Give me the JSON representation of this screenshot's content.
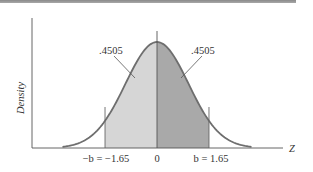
{
  "chart_data": {
    "type": "area",
    "title": "",
    "xlabel": "Z",
    "ylabel": "Density",
    "distribution": "standard normal",
    "x_ticks": [
      {
        "value": -1.65,
        "label": "−b = −1.65"
      },
      {
        "value": 0,
        "label": "0"
      },
      {
        "value": 1.65,
        "label": "b = 1.65"
      }
    ],
    "shaded_regions": [
      {
        "from": -1.65,
        "to": 0,
        "area": 0.4505,
        "label": ".4505",
        "color": "#d6d6d6"
      },
      {
        "from": 0,
        "to": 1.65,
        "area": 0.4505,
        "label": ".4505",
        "color": "#a9a9a9"
      }
    ],
    "xlim": [
      -3.2,
      3.2
    ],
    "grid": false,
    "legend": null
  },
  "labels": {
    "ylabel": "Density",
    "xlabel": "Z",
    "tick_left": "−b = −1.65",
    "tick_center": "0",
    "tick_right": "b = 1.65",
    "area_left": ".4505",
    "area_right": ".4505"
  },
  "colors": {
    "curve": "#6e6e6e",
    "axis": "#555555",
    "left_fill": "#d6d6d6",
    "right_fill": "#a9a9a9",
    "top_rule": "#9a9a9a"
  }
}
